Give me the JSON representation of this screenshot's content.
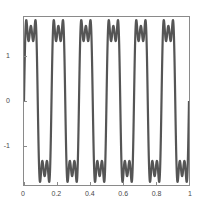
{
  "chart_data": {
    "type": "line",
    "title": "",
    "xlabel": "",
    "ylabel": "",
    "xlim": [
      0,
      1
    ],
    "ylim": [
      -1.85,
      1.85
    ],
    "grid": false,
    "legend": null,
    "xticks": [
      0,
      0.2,
      0.4,
      0.6,
      0.8,
      1
    ],
    "xtick_labels": [
      "0",
      "0.2",
      "0.4",
      "0.6",
      "0.8",
      "1"
    ],
    "yticks": [
      -1,
      0,
      1
    ],
    "ytick_labels": [
      "-1",
      "0",
      "1"
    ],
    "line_color": "#555555",
    "cycles": 6,
    "amplitude_peak": 1.78,
    "amplitude_trough": -1.78,
    "series": [
      {
        "name": "fourier-square-wave",
        "x": [
          0,
          0.02,
          0.04,
          0.06,
          0.08,
          0.1,
          0.12,
          0.14,
          0.16,
          0.18,
          0.2,
          0.22,
          0.24,
          0.26,
          0.28,
          0.3,
          0.32,
          0.34,
          0.36,
          0.38,
          0.4,
          0.42,
          0.44,
          0.46,
          0.48,
          0.5,
          0.52,
          0.54,
          0.56,
          0.58,
          0.6,
          0.62,
          0.64,
          0.66,
          0.68,
          0.7,
          0.72,
          0.74,
          0.76,
          0.78,
          0.8,
          0.82,
          0.84,
          0.86,
          0.88,
          0.9,
          0.92,
          0.94,
          0.96,
          0.98,
          1
        ],
        "y": [
          0,
          1.62,
          1.78,
          1.45,
          1.72,
          1.3,
          -0.4,
          -1.72,
          -1.45,
          -1.78,
          -1.55,
          0.6,
          1.78,
          1.5,
          1.75,
          1.2,
          -0.6,
          -1.75,
          -1.46,
          -1.78,
          -1.42,
          0.9,
          1.76,
          1.48,
          1.76,
          1.0,
          -0.9,
          -1.76,
          -1.46,
          -1.78,
          -1.2,
          1.1,
          1.75,
          1.47,
          1.77,
          0.75,
          -1.15,
          -1.77,
          -1.45,
          -1.78,
          -0.9,
          1.35,
          1.74,
          1.46,
          1.77,
          0.4,
          -1.4,
          -1.78,
          -1.44,
          -1.76,
          -0.45
        ]
      }
    ]
  },
  "axes": {
    "frame_color": "#8a8a8a",
    "tick_color": "#4a4a4a"
  }
}
